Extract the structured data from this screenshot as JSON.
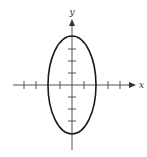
{
  "diagram": {
    "type": "ellipse-on-cartesian-axes",
    "x_axis": {
      "label": "x",
      "tick_positions": [
        -4,
        -3,
        -1,
        1,
        3,
        4
      ],
      "range": [
        -5,
        5.25
      ]
    },
    "y_axis": {
      "label": "y",
      "tick_positions": [
        -3,
        -2,
        -1,
        1,
        2,
        3
      ],
      "range": [
        -5.5,
        5.5
      ]
    },
    "ellipse": {
      "center": [
        0,
        0
      ],
      "semi_axis_x": 2,
      "semi_axis_y": 4,
      "stroke_color": "#1a1a1a"
    },
    "axis_color": "#555555"
  }
}
